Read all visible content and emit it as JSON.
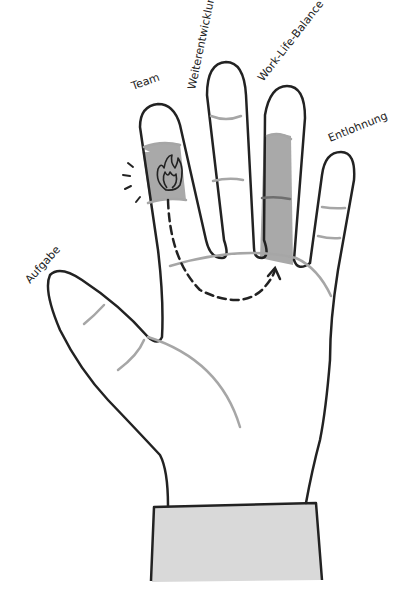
{
  "diagram": {
    "type": "illustrated-hand",
    "labels": {
      "thumb": "Aufgabe",
      "index": "Team",
      "middle": "Weiterentwicklung",
      "ring": "Work-Life-Balance",
      "pinky": "Entlohnung"
    },
    "highlighted_fingers": [
      "Team",
      "Work-Life-Balance"
    ],
    "icons": {
      "flame": "flame-icon",
      "arrow": "dashed-arrow-icon"
    },
    "colors": {
      "outline": "#222222",
      "crease": "#a6a6a6",
      "highlight": "#a9a9a9",
      "sleeve": "#d9d9d9",
      "background": "#ffffff"
    }
  }
}
